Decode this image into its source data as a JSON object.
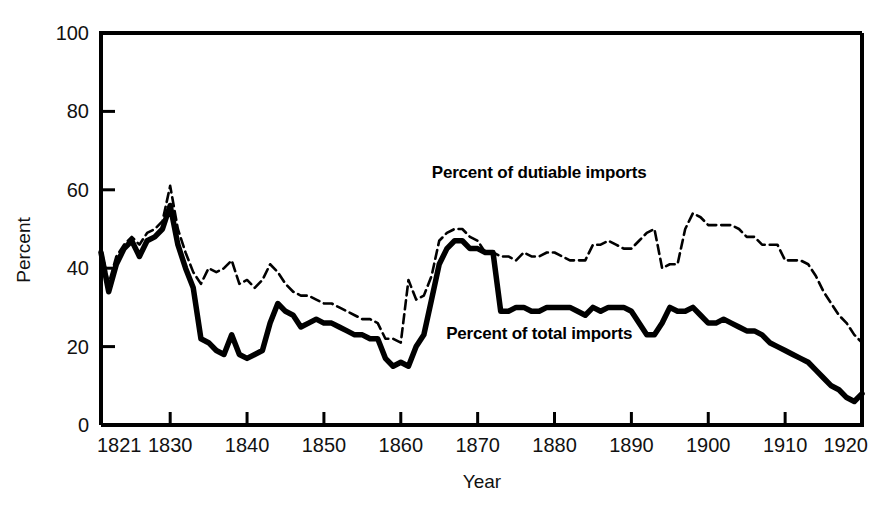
{
  "chart_data": {
    "type": "line",
    "title": "",
    "xlabel": "Year",
    "ylabel": "Percent",
    "xlim": [
      1821,
      1920
    ],
    "ylim": [
      0,
      100
    ],
    "grid": false,
    "legend_position": "inline-annotation",
    "x_ticks": [
      "1821",
      "1830",
      "1840",
      "1850",
      "1860",
      "1870",
      "1880",
      "1890",
      "1900",
      "1910",
      "1920"
    ],
    "x_tick_values": [
      1821,
      1830,
      1840,
      1850,
      1860,
      1870,
      1880,
      1890,
      1900,
      1910,
      1920
    ],
    "y_ticks": [
      "0",
      "20",
      "40",
      "60",
      "80",
      "100"
    ],
    "y_tick_values": [
      0,
      20,
      40,
      60,
      80,
      100
    ],
    "x": [
      1821,
      1822,
      1823,
      1824,
      1825,
      1826,
      1827,
      1828,
      1829,
      1830,
      1831,
      1832,
      1833,
      1834,
      1835,
      1836,
      1837,
      1838,
      1839,
      1840,
      1841,
      1842,
      1843,
      1844,
      1845,
      1846,
      1847,
      1848,
      1849,
      1850,
      1851,
      1852,
      1853,
      1854,
      1855,
      1856,
      1857,
      1858,
      1859,
      1860,
      1861,
      1862,
      1863,
      1864,
      1865,
      1866,
      1867,
      1868,
      1869,
      1870,
      1871,
      1872,
      1873,
      1874,
      1875,
      1876,
      1877,
      1878,
      1879,
      1880,
      1881,
      1882,
      1883,
      1884,
      1885,
      1886,
      1887,
      1888,
      1889,
      1890,
      1891,
      1892,
      1893,
      1894,
      1895,
      1896,
      1897,
      1898,
      1899,
      1900,
      1901,
      1902,
      1903,
      1904,
      1905,
      1906,
      1907,
      1908,
      1909,
      1910,
      1911,
      1912,
      1913,
      1914,
      1915,
      1916,
      1917,
      1918,
      1919,
      1920
    ],
    "series": [
      {
        "name": "Percent of dutiable imports",
        "style": "dashed",
        "color": "#000000",
        "values": [
          45,
          36,
          43,
          46,
          48,
          46,
          49,
          50,
          52,
          61,
          50,
          44,
          39,
          36,
          40,
          39,
          40,
          42,
          36,
          37,
          35,
          37,
          41,
          39,
          36,
          34,
          33,
          33,
          32,
          31,
          31,
          30,
          29,
          28,
          27,
          27,
          26,
          22,
          22,
          21,
          37,
          32,
          33,
          38,
          47,
          49,
          50,
          50,
          48,
          47,
          44,
          44,
          43,
          43,
          42,
          44,
          43,
          43,
          44,
          44,
          43,
          42,
          42,
          42,
          46,
          46,
          47,
          46,
          45,
          45,
          47,
          49,
          50,
          40,
          41,
          41,
          50,
          54,
          53,
          51,
          51,
          51,
          51,
          50,
          48,
          48,
          46,
          46,
          46,
          42,
          42,
          42,
          41,
          38,
          34,
          31,
          28,
          26,
          23,
          21
        ]
      },
      {
        "name": "Percent of total imports",
        "style": "solid",
        "color": "#000000",
        "values": [
          44,
          34,
          41,
          45,
          47,
          43,
          47,
          48,
          50,
          56,
          46,
          40,
          35,
          22,
          21,
          19,
          18,
          23,
          18,
          17,
          18,
          19,
          26,
          31,
          29,
          28,
          25,
          26,
          27,
          26,
          26,
          25,
          24,
          23,
          23,
          22,
          22,
          17,
          15,
          16,
          15,
          20,
          23,
          32,
          41,
          45,
          47,
          47,
          45,
          45,
          44,
          44,
          29,
          29,
          30,
          30,
          29,
          29,
          30,
          30,
          30,
          30,
          29,
          28,
          30,
          29,
          30,
          30,
          30,
          29,
          26,
          23,
          23,
          26,
          30,
          29,
          29,
          30,
          28,
          26,
          26,
          27,
          26,
          25,
          24,
          24,
          23,
          21,
          20,
          19,
          18,
          17,
          16,
          14,
          12,
          10,
          9,
          7,
          6,
          8
        ]
      }
    ],
    "annotations": [
      {
        "text": "Percent of dutiable imports",
        "x": 1878,
        "y": 63
      },
      {
        "text": "Percent of total imports",
        "x": 1878,
        "y": 22
      }
    ]
  }
}
